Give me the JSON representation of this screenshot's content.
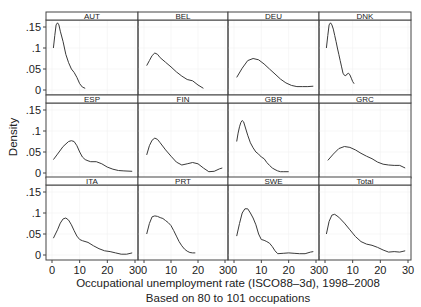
{
  "chart_data": {
    "type": "line",
    "title": "",
    "xlabel": "Occupational unemployment rate (ISCO88-3d), 1998-2008",
    "subtitle": "Based on 80 to 101 occupations",
    "ylabel": "Density",
    "xlim": [
      0,
      30
    ],
    "ylim": [
      0,
      0.165
    ],
    "xticks": [
      0,
      10,
      20,
      30
    ],
    "xtick_labels": [
      "0",
      "10",
      "20",
      "30"
    ],
    "yticks": [
      0,
      0.05,
      0.1,
      0.15
    ],
    "ytick_labels": [
      "0",
      ".05",
      ".1",
      ".15"
    ],
    "grid": true,
    "layout": {
      "rows": 3,
      "cols": 4
    },
    "panels": [
      {
        "name": "AUT",
        "x": [
          0.5,
          1,
          1.5,
          2,
          2.5,
          3,
          4,
          5,
          6,
          7,
          8,
          9,
          10,
          11,
          12
        ],
        "y": [
          0.1,
          0.13,
          0.155,
          0.16,
          0.155,
          0.14,
          0.115,
          0.085,
          0.065,
          0.05,
          0.042,
          0.03,
          0.015,
          0.007,
          0.004
        ]
      },
      {
        "name": "BEL",
        "x": [
          1,
          2,
          3,
          4,
          5,
          6,
          8,
          10,
          12,
          14,
          16,
          18,
          20,
          22
        ],
        "y": [
          0.058,
          0.07,
          0.082,
          0.088,
          0.085,
          0.077,
          0.066,
          0.055,
          0.043,
          0.033,
          0.025,
          0.022,
          0.012,
          0.004
        ]
      },
      {
        "name": "DEU",
        "x": [
          1,
          3,
          5,
          7,
          9,
          11,
          13,
          15,
          17,
          19,
          21,
          23,
          25,
          27,
          29
        ],
        "y": [
          0.03,
          0.052,
          0.07,
          0.075,
          0.072,
          0.062,
          0.05,
          0.038,
          0.026,
          0.017,
          0.011,
          0.008,
          0.008,
          0.008,
          0.009
        ]
      },
      {
        "name": "DNK",
        "x": [
          0.5,
          1,
          1.5,
          2,
          2.5,
          3,
          3.5,
          4,
          4.5,
          5,
          5.5,
          6,
          6.5,
          7,
          7.5,
          8,
          8.5,
          9,
          9.5,
          10,
          10.5
        ],
        "y": [
          0.1,
          0.13,
          0.155,
          0.16,
          0.155,
          0.145,
          0.13,
          0.115,
          0.1,
          0.085,
          0.07,
          0.055,
          0.04,
          0.035,
          0.034,
          0.038,
          0.04,
          0.036,
          0.028,
          0.02,
          0.015
        ]
      },
      {
        "name": "ESP",
        "x": [
          0.5,
          2,
          4,
          6,
          7,
          8,
          9,
          10,
          11,
          12,
          13,
          14,
          16,
          18,
          20,
          22,
          24,
          26,
          29
        ],
        "y": [
          0.032,
          0.045,
          0.063,
          0.075,
          0.077,
          0.075,
          0.065,
          0.05,
          0.038,
          0.032,
          0.029,
          0.027,
          0.027,
          0.022,
          0.014,
          0.009,
          0.006,
          0.005,
          0.004
        ]
      },
      {
        "name": "FIN",
        "x": [
          1,
          2,
          3,
          4,
          5,
          6,
          8,
          10,
          12,
          14,
          16,
          18,
          20,
          22,
          24,
          26,
          28,
          29
        ],
        "y": [
          0.043,
          0.065,
          0.078,
          0.083,
          0.08,
          0.072,
          0.055,
          0.04,
          0.026,
          0.019,
          0.022,
          0.025,
          0.022,
          0.012,
          0.003,
          0.004,
          0.01,
          0.012
        ]
      },
      {
        "name": "GBR",
        "x": [
          1,
          1.5,
          2,
          2.5,
          3,
          3.5,
          4,
          5,
          6,
          7,
          8,
          9,
          10,
          11,
          12,
          13,
          14,
          15,
          16,
          17,
          18,
          20
        ],
        "y": [
          0.075,
          0.095,
          0.11,
          0.12,
          0.125,
          0.122,
          0.112,
          0.09,
          0.072,
          0.06,
          0.05,
          0.045,
          0.038,
          0.034,
          0.025,
          0.018,
          0.012,
          0.008,
          0.005,
          0.003,
          0.003,
          0.003
        ]
      },
      {
        "name": "GRC",
        "x": [
          1,
          3,
          5,
          7,
          9,
          11,
          13,
          15,
          17,
          19,
          21,
          23,
          25,
          27,
          29
        ],
        "y": [
          0.03,
          0.045,
          0.058,
          0.063,
          0.061,
          0.055,
          0.047,
          0.04,
          0.034,
          0.026,
          0.021,
          0.019,
          0.018,
          0.018,
          0.012
        ]
      },
      {
        "name": "ITA",
        "x": [
          0.5,
          2,
          3,
          4,
          5,
          6,
          7,
          8,
          9,
          10,
          11,
          13,
          15,
          17,
          19,
          21,
          23,
          25,
          27,
          29
        ],
        "y": [
          0.04,
          0.06,
          0.076,
          0.086,
          0.088,
          0.083,
          0.072,
          0.058,
          0.045,
          0.037,
          0.034,
          0.03,
          0.022,
          0.015,
          0.01,
          0.008,
          0.005,
          0.002,
          0.002,
          0.005
        ]
      },
      {
        "name": "PRT",
        "x": [
          1,
          2,
          3,
          4,
          5,
          6,
          7,
          8,
          9,
          10,
          11,
          12,
          13,
          14,
          15,
          16,
          17,
          18,
          19
        ],
        "y": [
          0.05,
          0.075,
          0.091,
          0.093,
          0.092,
          0.089,
          0.087,
          0.082,
          0.077,
          0.07,
          0.058,
          0.045,
          0.032,
          0.022,
          0.014,
          0.009,
          0.006,
          0.005,
          0.005
        ]
      },
      {
        "name": "SWE",
        "x": [
          1,
          2,
          3,
          4,
          5,
          6,
          7,
          8,
          9,
          10,
          11,
          12,
          13,
          14,
          15,
          16,
          18,
          20,
          22,
          24,
          26,
          28,
          29
        ],
        "y": [
          0.045,
          0.075,
          0.1,
          0.11,
          0.11,
          0.1,
          0.088,
          0.072,
          0.05,
          0.037,
          0.035,
          0.032,
          0.028,
          0.02,
          0.01,
          0.003,
          0.004,
          0.005,
          0.004,
          0.003,
          0.003,
          0.007,
          0.008
        ]
      },
      {
        "name": "Total",
        "x": [
          0.5,
          1.5,
          2.5,
          3.5,
          5,
          7,
          9,
          11,
          13,
          15,
          17,
          19,
          21,
          23,
          25,
          27,
          29
        ],
        "y": [
          0.05,
          0.08,
          0.095,
          0.097,
          0.09,
          0.076,
          0.06,
          0.044,
          0.032,
          0.026,
          0.023,
          0.018,
          0.012,
          0.007,
          0.008,
          0.007,
          0.01
        ]
      }
    ]
  },
  "axes": {
    "ylabel": "Density",
    "xlabel": "Occupational unemployment rate (ISCO88–3d), 1998–2008",
    "note": "Based on 80 to 101 occupations"
  }
}
